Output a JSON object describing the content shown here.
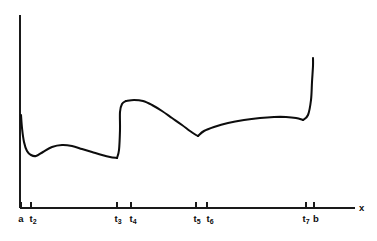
{
  "figure": {
    "background_color": "#ffffff",
    "ink_color": "#0d0d0d",
    "axis_color": "#1a1a1a",
    "width": 377,
    "height": 241
  },
  "axes": {
    "x_axis": {
      "label": "x",
      "label_x": 359,
      "label_y": 203,
      "y_pixel": 208,
      "x_start": 20,
      "x_end": 355
    },
    "y_axis": {
      "label": "",
      "x_pixel": 20,
      "y_top": 15,
      "y_bottom": 208
    }
  },
  "ticks": [
    {
      "id": "a",
      "text": "a",
      "sub": "",
      "x": 21,
      "label_x": 21,
      "label_y": 214
    },
    {
      "id": "t2",
      "text": "t",
      "sub": "2",
      "x": 31,
      "label_x": 33,
      "label_y": 214
    },
    {
      "id": "t3",
      "text": "t",
      "sub": "3",
      "x": 117,
      "label_x": 118,
      "label_y": 214
    },
    {
      "id": "t4",
      "text": "t",
      "sub": "4",
      "x": 131,
      "label_x": 133,
      "label_y": 214
    },
    {
      "id": "t5",
      "text": "t",
      "sub": "5",
      "x": 196,
      "label_x": 197,
      "label_y": 214
    },
    {
      "id": "t6",
      "text": "t",
      "sub": "6",
      "x": 207,
      "label_x": 210,
      "label_y": 214
    },
    {
      "id": "t7",
      "text": "t",
      "sub": "7",
      "x": 306,
      "label_x": 306,
      "label_y": 214
    },
    {
      "id": "b",
      "text": "b",
      "sub": "",
      "x": 314,
      "label_x": 316,
      "label_y": 214
    }
  ],
  "chart_data": {
    "type": "line",
    "title": "",
    "subtitle": "",
    "xlabel": "x",
    "ylabel": "",
    "grid": false,
    "legend": null,
    "axis_style": "half-open axes, ticks below x-axis only, no numeric scale",
    "xlim": [
      20,
      355
    ],
    "ylim": [
      208,
      15
    ],
    "note": "y coordinates are screen pixels (smaller = higher on the plot). Curve is piecewise: a smooth bump on [a,t3], an upward jump discontinuity at t3->t4, a smooth arc down to a corner/cusp at t5-t6, then a long shallow rise to t7 followed by a steep blow-up at b.",
    "tick_labels": [
      "a",
      "t2",
      "t3",
      "t4",
      "t5",
      "t6",
      "t7",
      "b"
    ],
    "tick_positions_px": [
      21,
      31,
      117,
      131,
      196,
      207,
      306,
      314
    ],
    "segments": [
      {
        "name": "segment-1-initial-drop-and-bump",
        "from": "a",
        "to": "t3",
        "points_px": [
          [
            21,
            115
          ],
          [
            22,
            128
          ],
          [
            24,
            142
          ],
          [
            27,
            151
          ],
          [
            31,
            155
          ],
          [
            36,
            156
          ],
          [
            43,
            152
          ],
          [
            52,
            147
          ],
          [
            62,
            145
          ],
          [
            72,
            146
          ],
          [
            82,
            149
          ],
          [
            92,
            152
          ],
          [
            102,
            155
          ],
          [
            110,
            157
          ],
          [
            117,
            158
          ]
        ]
      },
      {
        "name": "segment-2-vertical-jump",
        "from": "t3",
        "to": "t4",
        "points_px": [
          [
            117,
            158
          ],
          [
            119,
            150
          ],
          [
            120,
            130
          ],
          [
            120,
            112
          ],
          [
            122,
            104
          ],
          [
            126,
            101
          ]
        ]
      },
      {
        "name": "segment-3-arc-down-to-cusp",
        "from": "t4",
        "to": "t5",
        "points_px": [
          [
            126,
            101
          ],
          [
            134,
            100
          ],
          [
            143,
            101
          ],
          [
            152,
            105
          ],
          [
            162,
            111
          ],
          [
            172,
            118
          ],
          [
            182,
            125
          ],
          [
            190,
            131
          ],
          [
            196,
            135
          ],
          [
            198,
            136
          ]
        ]
      },
      {
        "name": "segment-4-shallow-rise",
        "from": "t6",
        "to": "t7",
        "points_px": [
          [
            198,
            136
          ],
          [
            204,
            131
          ],
          [
            214,
            127
          ],
          [
            228,
            123
          ],
          [
            244,
            120
          ],
          [
            260,
            118
          ],
          [
            274,
            117
          ],
          [
            286,
            117
          ],
          [
            296,
            118
          ],
          [
            303,
            120
          ]
        ]
      },
      {
        "name": "segment-5-steep-blowup",
        "from": "t7",
        "to": "b",
        "points_px": [
          [
            303,
            120
          ],
          [
            308,
            115
          ],
          [
            311,
            100
          ],
          [
            312,
            82
          ],
          [
            313,
            66
          ],
          [
            313,
            58
          ]
        ]
      }
    ]
  }
}
